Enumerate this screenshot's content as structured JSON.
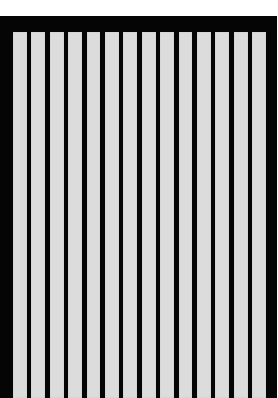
{
  "image": {
    "description": "Black rectangular frame filled with vertical light-gray stripes",
    "colors": {
      "background": "#ffffff",
      "frame": "#050505",
      "stripe": "#dcdcdc"
    },
    "stripes": {
      "count": 14,
      "items": [
        {
          "index": 1
        },
        {
          "index": 2
        },
        {
          "index": 3
        },
        {
          "index": 4
        },
        {
          "index": 5
        },
        {
          "index": 6
        },
        {
          "index": 7
        },
        {
          "index": 8
        },
        {
          "index": 9
        },
        {
          "index": 10
        },
        {
          "index": 11
        },
        {
          "index": 12
        },
        {
          "index": 13
        },
        {
          "index": 14
        }
      ]
    }
  }
}
